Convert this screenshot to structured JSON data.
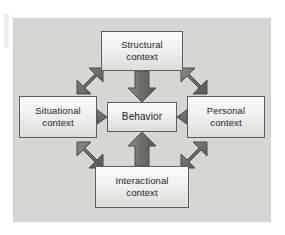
{
  "figure": {
    "kind": "cycle-diagram",
    "panel_background": "#d6d6d4",
    "box_border_color": "#5e5e5e",
    "arrow_color": "#6e6e6e",
    "arrow_outline_color": "#4a4a4a",
    "center": {
      "name": "behavior",
      "label": "Behavior",
      "line1": "Behavior",
      "line2": ""
    },
    "nodes": [
      {
        "name": "structural-context",
        "label": "Structural context",
        "line1": "Structural",
        "line2": "context",
        "position": "top"
      },
      {
        "name": "situational-context",
        "label": "Situational context",
        "line1": "Situational",
        "line2": "context",
        "position": "left"
      },
      {
        "name": "personal-context",
        "label": "Personal context",
        "line1": "Personal",
        "line2": "context",
        "position": "right"
      },
      {
        "name": "interactional-context",
        "label": "Interactional context",
        "line1": "Interactional",
        "line2": "context",
        "position": "bottom"
      }
    ],
    "arrows": [
      {
        "name": "arrow-structural-to-behavior",
        "from": "structural-context",
        "to": "behavior",
        "direction": "down",
        "heads": 1
      },
      {
        "name": "arrow-situational-to-behavior",
        "from": "situational-context",
        "to": "behavior",
        "direction": "right",
        "heads": 1
      },
      {
        "name": "arrow-personal-to-behavior",
        "from": "personal-context",
        "to": "behavior",
        "direction": "left",
        "heads": 1
      },
      {
        "name": "arrow-interactional-to-behavior",
        "from": "interactional-context",
        "to": "behavior",
        "direction": "up",
        "heads": 1
      },
      {
        "name": "arrow-situational-structural",
        "from": "situational-context",
        "to": "structural-context",
        "direction": "diagonal-up-right",
        "heads": 2
      },
      {
        "name": "arrow-structural-personal",
        "from": "structural-context",
        "to": "personal-context",
        "direction": "diagonal-down-right",
        "heads": 2
      },
      {
        "name": "arrow-situational-interactional",
        "from": "situational-context",
        "to": "interactional-context",
        "direction": "diagonal-down-right",
        "heads": 2
      },
      {
        "name": "arrow-interactional-personal",
        "from": "interactional-context",
        "to": "personal-context",
        "direction": "diagonal-up-right",
        "heads": 2
      }
    ]
  }
}
